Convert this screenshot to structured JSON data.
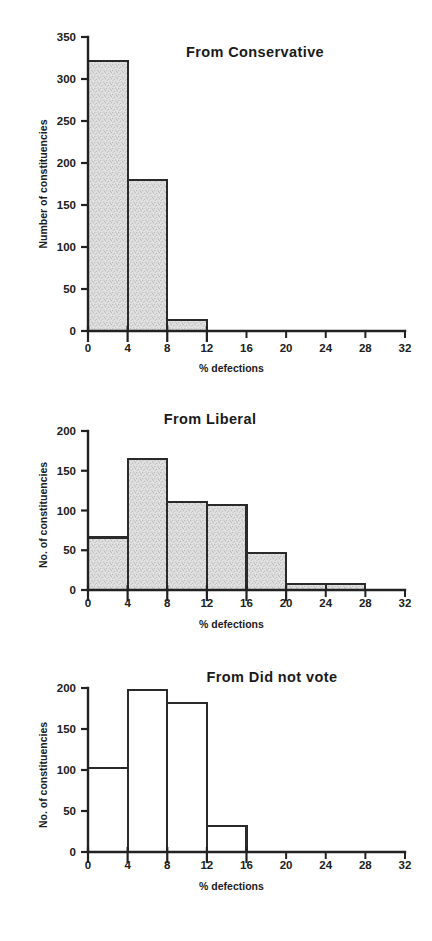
{
  "figure": {
    "background_color": "#ffffff",
    "ink_color": "#222222",
    "fill_color": "#dedede"
  },
  "chart_data": [
    {
      "type": "bar",
      "title": "From Conservative",
      "xlabel": "% defections",
      "ylabel": "Number of constituencies",
      "xlim": [
        0,
        32
      ],
      "ylim": [
        0,
        350
      ],
      "xticks": [
        0,
        4,
        8,
        12,
        16,
        20,
        24,
        28,
        32
      ],
      "xticklabels": [
        "0",
        "4",
        "8",
        "12",
        "16",
        "20",
        "24",
        "28",
        "32"
      ],
      "yticks": [
        0,
        50,
        100,
        150,
        200,
        250,
        300,
        350
      ],
      "yticklabels": [
        "0",
        "50",
        "100",
        "150",
        "200",
        "250",
        "300",
        "350"
      ],
      "bin_edges": [
        0,
        4,
        8,
        12,
        16,
        20,
        24,
        28,
        32
      ],
      "categories": [
        "0-4",
        "4-8",
        "8-12",
        "12-16",
        "16-20",
        "20-24",
        "24-28",
        "28-32"
      ],
      "values": [
        321,
        180,
        13,
        0,
        0,
        0,
        0,
        0
      ],
      "bar_style": "filled",
      "grid": false,
      "legend": "none"
    },
    {
      "type": "bar",
      "title": "From Liberal",
      "xlabel": "% defections",
      "ylabel": "No. of constituencies",
      "xlim": [
        0,
        32
      ],
      "ylim": [
        0,
        200
      ],
      "xticks": [
        0,
        4,
        8,
        12,
        16,
        20,
        24,
        28,
        32
      ],
      "xticklabels": [
        "0",
        "4",
        "8",
        "12",
        "16",
        "20",
        "24",
        "28",
        "32"
      ],
      "yticks": [
        0,
        50,
        100,
        150,
        200
      ],
      "yticklabels": [
        "0",
        "50",
        "100",
        "150",
        "200"
      ],
      "bin_edges": [
        0,
        4,
        8,
        12,
        16,
        20,
        24,
        28,
        32
      ],
      "categories": [
        "0-4",
        "4-8",
        "8-12",
        "12-16",
        "16-20",
        "20-24",
        "24-28",
        "28-32"
      ],
      "values": [
        66,
        165,
        111,
        107,
        47,
        8,
        8,
        0
      ],
      "bar_style": "filled",
      "grid": false,
      "legend": "none"
    },
    {
      "type": "bar",
      "title": "From Did not vote",
      "xlabel": "% defections",
      "ylabel": "No. of constituencies",
      "xlim": [
        0,
        32
      ],
      "ylim": [
        0,
        200
      ],
      "xticks": [
        0,
        4,
        8,
        12,
        16,
        20,
        24,
        28,
        32
      ],
      "xticklabels": [
        "0",
        "4",
        "8",
        "12",
        "16",
        "20",
        "24",
        "28",
        "32"
      ],
      "yticks": [
        0,
        50,
        100,
        150,
        200
      ],
      "yticklabels": [
        "0",
        "50",
        "100",
        "150",
        "200"
      ],
      "bin_edges": [
        0,
        4,
        8,
        12,
        16,
        20,
        24,
        28,
        32
      ],
      "categories": [
        "0-4",
        "4-8",
        "8-12",
        "12-16",
        "16-20",
        "20-24",
        "24-28",
        "28-32"
      ],
      "values": [
        102,
        198,
        182,
        32,
        0,
        0,
        0,
        0
      ],
      "bar_style": "empty",
      "grid": false,
      "legend": "none"
    }
  ]
}
